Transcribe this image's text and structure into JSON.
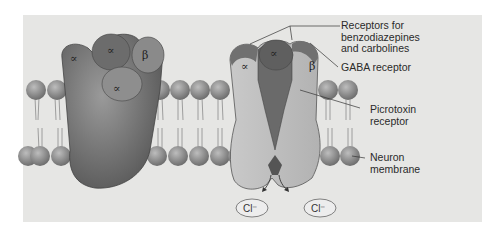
{
  "diagram": {
    "type": "biology-illustration",
    "left_complex": {
      "subunits": [
        "∝",
        "∝",
        "β",
        "∝"
      ]
    },
    "right_complex_cutaway": {
      "subunits": [
        "∝",
        "∝",
        "β"
      ]
    },
    "ions": [
      {
        "label": "Cl⁻"
      },
      {
        "label": "Cl⁻"
      }
    ],
    "labels": [
      {
        "id": "benzo",
        "text": "Receptors for\nbenzodiazepines\nand carbolines"
      },
      {
        "id": "gaba",
        "text": "GABA receptor"
      },
      {
        "id": "picro",
        "text": "Picrotoxin\nreceptor"
      },
      {
        "id": "membrane",
        "text": "Neuron\nmembrane"
      }
    ]
  }
}
